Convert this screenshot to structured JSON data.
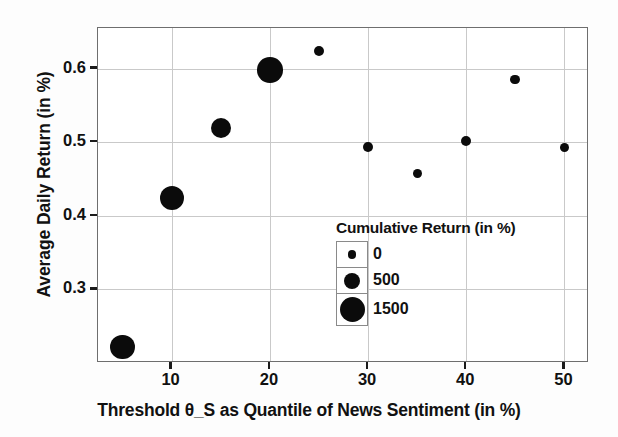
{
  "chart_data": {
    "type": "scatter",
    "title": "",
    "xlabel": "Threshold θ_S as Quantile of News Sentiment (in %)",
    "ylabel": "Average Daily Return (in %)",
    "xlim": [
      2.5,
      52.5
    ],
    "ylim": [
      0.2,
      0.655
    ],
    "grid": true,
    "legend_position": "inside-lower-right",
    "xticks": [
      "10",
      "20",
      "30",
      "40",
      "50"
    ],
    "xtick_values": [
      10,
      20,
      30,
      40,
      50
    ],
    "yticks": [
      "0.6",
      "0.5",
      "0.4",
      "0.3"
    ],
    "ytick_values": [
      0.6,
      0.5,
      0.4,
      0.3
    ],
    "size_legend": {
      "title": "Cumulative Return (in %)",
      "entries": [
        {
          "label": "0",
          "value": 0,
          "radius_px": 4.2
        },
        {
          "label": "500",
          "value": 500,
          "radius_px": 8.0
        },
        {
          "label": "1500",
          "value": 1500,
          "radius_px": 12.5
        }
      ]
    },
    "series": [
      {
        "name": "Strategy outcome by sentiment threshold",
        "marker_color": "#0b0b0b",
        "points": [
          {
            "x": 5,
            "y": 0.222,
            "size": 1450,
            "radius_px": 12.2
          },
          {
            "x": 10,
            "y": 0.424,
            "size": 1400,
            "radius_px": 12.0
          },
          {
            "x": 15,
            "y": 0.519,
            "size": 1000,
            "radius_px": 10.3
          },
          {
            "x": 20,
            "y": 0.598,
            "size": 1550,
            "radius_px": 12.8
          },
          {
            "x": 25,
            "y": 0.624,
            "size": 150,
            "radius_px": 5.1
          },
          {
            "x": 30,
            "y": 0.493,
            "size": 120,
            "radius_px": 4.9
          },
          {
            "x": 35,
            "y": 0.457,
            "size": 100,
            "radius_px": 4.7
          },
          {
            "x": 40,
            "y": 0.501,
            "size": 130,
            "radius_px": 5.0
          },
          {
            "x": 45,
            "y": 0.585,
            "size": 120,
            "radius_px": 4.9
          },
          {
            "x": 50,
            "y": 0.493,
            "size": 110,
            "radius_px": 4.8
          }
        ]
      }
    ]
  },
  "colors": {
    "marker": "#0b0b0b",
    "grid": "#c9c9c9",
    "frame": "#6e6e6e",
    "text": "#111111",
    "background": "#ffffff"
  }
}
